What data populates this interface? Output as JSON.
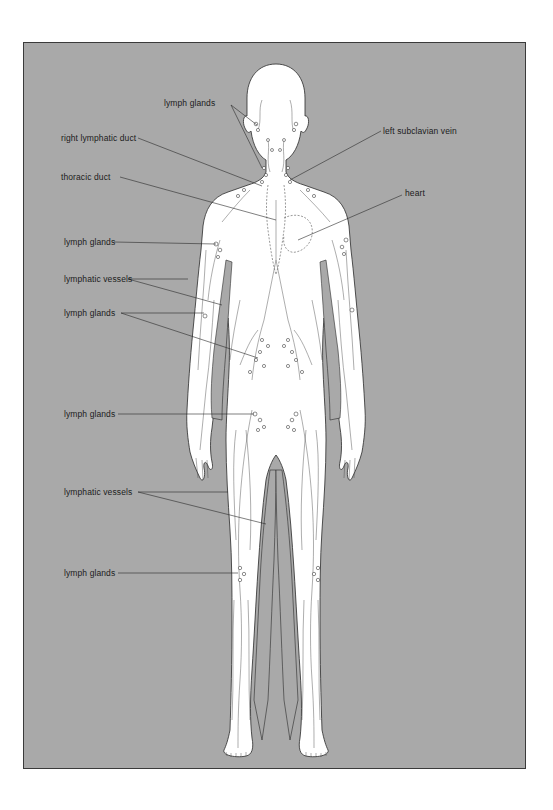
{
  "figure": {
    "background_color": "#a9a9a9",
    "frame_border_color": "#3a3a3a",
    "body_color": "#ffffff",
    "labels": [
      {
        "id": "lymph-glands-head",
        "text": "lymph glands",
        "side": "left",
        "points_to": [
          "head",
          "neck"
        ]
      },
      {
        "id": "right-lymphatic-duct",
        "text": "right lymphatic duct",
        "side": "left",
        "points_to": [
          "right lymphatic duct"
        ]
      },
      {
        "id": "left-subclavian-vein",
        "text": "left subclavian vein",
        "side": "right",
        "points_to": [
          "left subclavian vein"
        ]
      },
      {
        "id": "thoracic-duct",
        "text": "thoracic duct",
        "side": "left",
        "points_to": [
          "thoracic duct"
        ]
      },
      {
        "id": "heart",
        "text": "heart",
        "side": "right",
        "points_to": [
          "heart"
        ]
      },
      {
        "id": "lymph-glands-axilla",
        "text": "lymph glands",
        "side": "left",
        "points_to": [
          "armpit"
        ]
      },
      {
        "id": "lymphatic-vessels-arm",
        "text": "lymphatic vessels",
        "side": "left",
        "points_to": [
          "upper arm",
          "inner arm"
        ]
      },
      {
        "id": "lymph-glands-elbow-abdomen",
        "text": "lymph glands",
        "side": "left",
        "points_to": [
          "elbow",
          "abdomen"
        ]
      },
      {
        "id": "lymph-glands-groin",
        "text": "lymph glands",
        "side": "left",
        "points_to": [
          "groin"
        ]
      },
      {
        "id": "lymphatic-vessels-leg",
        "text": "lymphatic vessels",
        "side": "left",
        "points_to": [
          "thigh",
          "inner thigh"
        ]
      },
      {
        "id": "lymph-glands-knee",
        "text": "lymph glands",
        "side": "left",
        "points_to": [
          "knee"
        ]
      }
    ]
  }
}
